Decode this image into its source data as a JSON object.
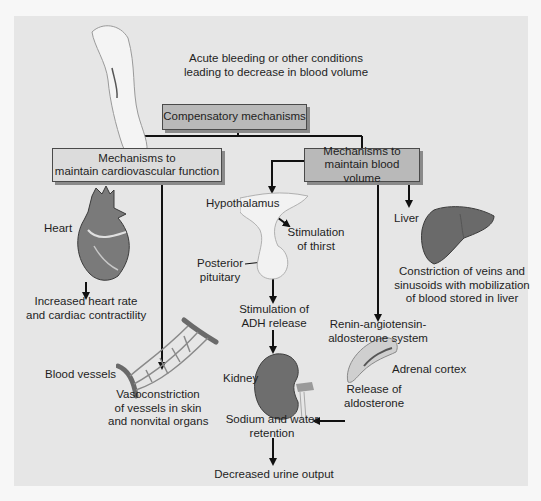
{
  "diagram": {
    "top_text": [
      "Acute bleeding or other conditions",
      "leading to decrease in blood volume"
    ],
    "root_box": "Compensatory mechanisms",
    "left_branch": {
      "box": [
        "Mechanisms to",
        "maintain cardiovascular function"
      ],
      "heart_label": "Heart",
      "heart_effect": [
        "Increased heart rate",
        "and cardiac contractility"
      ],
      "vessels_label": "Blood vessels",
      "vessels_effect": [
        "Vasoconstriction",
        "of vessels in skin",
        "and nonvital organs"
      ]
    },
    "right_branch": {
      "box": [
        "Mechanisms to",
        "maintain blood volume"
      ],
      "hypothalamus_label": "Hypothalamus",
      "thirst": [
        "Stimulation",
        "of thirst"
      ],
      "posterior_pituitary": [
        "Posterior",
        "pituitary"
      ],
      "adh": [
        "Stimulation of",
        "ADH release"
      ],
      "kidney_label": "Kidney",
      "sodium": [
        "Sodium and water",
        "retention"
      ],
      "urine": "Decreased urine output",
      "raas": [
        "Renin-angiotensin-",
        "aldosterone system"
      ],
      "adrenal_label": "Adrenal cortex",
      "aldosterone": [
        "Release of",
        "aldosterone"
      ],
      "liver_label": "Liver",
      "liver_effect": [
        "Constriction of veins and",
        "sinusoids with mobilization",
        "of blood stored in liver"
      ]
    }
  },
  "colors": {
    "panel": "#e6e6e6",
    "box_dark": "#b9b9b9",
    "box_light": "#dcdcdc",
    "line": "#111111"
  }
}
